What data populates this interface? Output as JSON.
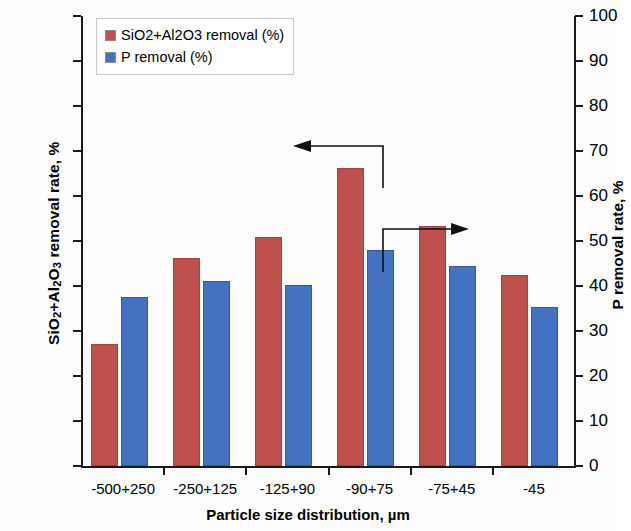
{
  "chart_data": {
    "type": "bar",
    "title": "",
    "xlabel": "Particle size distribution, µm",
    "ylabel": "SiO2+Al2O3 removal rate, %",
    "ylabel_right": "P removal rate, %",
    "categories": [
      "-500+250",
      "-250+125",
      "-125+90",
      "-90+75",
      "-75+45",
      "-45"
    ],
    "series": [
      {
        "name": "SiO2+Al2O3 removal (%)",
        "color": "#c0504d",
        "axis": "left",
        "values": [
          27.1,
          46.2,
          50.8,
          66.2,
          53.3,
          42.4
        ]
      },
      {
        "name": "P removal (%)",
        "color": "#4372c3",
        "axis": "right",
        "values": [
          37.6,
          41.1,
          40.2,
          48.0,
          44.4,
          35.4
        ]
      }
    ],
    "ylim": [
      0,
      100
    ],
    "ylim_right": [
      0,
      100
    ],
    "ytick_step": 10,
    "yticks": [
      0,
      10,
      20,
      30,
      40,
      50,
      60,
      70,
      80,
      90,
      100
    ],
    "yticks_right": [
      0,
      10,
      20,
      30,
      40,
      50,
      60,
      70,
      80,
      90,
      100
    ],
    "grid": false,
    "legend_position": "upper left",
    "annotations": [
      {
        "name": "left-axis-pointer",
        "direction": "left",
        "target_series": "SiO2+Al2O3 removal (%)",
        "target_category": "-90+75"
      },
      {
        "name": "right-axis-pointer",
        "direction": "right",
        "target_series": "P removal (%)",
        "target_category": "-90+75"
      }
    ]
  },
  "axis_left": {
    "title_part1": "SiO",
    "title_sub1": "2",
    "title_part2": "+Al",
    "title_sub2": "2",
    "title_part3": "O",
    "title_sub3": "3",
    "title_part4": " removal rate, %"
  },
  "axis_right": {
    "title": "P removal rate, %"
  },
  "axis_x": {
    "title": "Particle size distribution, µm"
  },
  "legend": {
    "items": [
      {
        "label": "SiO2+Al2O3 removal (%)",
        "swatch": "red"
      },
      {
        "label": "P removal (%)",
        "swatch": "blue"
      }
    ]
  }
}
